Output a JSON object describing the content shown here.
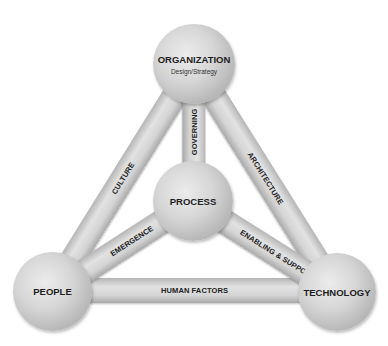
{
  "diagram": {
    "nodes": {
      "organization": {
        "title": "ORGANIZATION",
        "subtitle": "Design/Strategy"
      },
      "process": {
        "title": "PROCESS"
      },
      "people": {
        "title": "PEOPLE"
      },
      "technology": {
        "title": "TECHNOLOGY"
      }
    },
    "links": {
      "culture": "CULTURE",
      "architecture": "ARCHITECTURE",
      "governing": "GOVERNING",
      "emergence": "EMERGENCE",
      "enabling_support": "ENABLING & SUPPORT",
      "human_factors": "HUMAN FACTORS"
    },
    "colors": {
      "background": "#ffffff",
      "sphere": "#c8c8c8",
      "bar": "#d0d0d0",
      "text": "#222222"
    }
  }
}
